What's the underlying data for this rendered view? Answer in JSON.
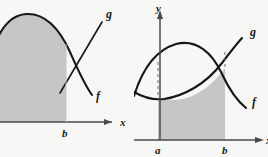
{
  "figure": {
    "background_color": "#f7f7f6",
    "shade_color": "#c6c6c4",
    "curve_color": "#161616",
    "axis_color": "#4a4a4a",
    "panels": [
      {
        "id": "left",
        "axes": {
          "x_label": "x",
          "y_label": "",
          "x_axis_visible": true,
          "y_axis_visible": false
        },
        "tick_labels": [
          "b"
        ],
        "curve_labels": [
          "g",
          "f"
        ],
        "description_curves": [
          {
            "name": "f",
            "label": "f",
            "shape": "downward parabola, cut off at left edge of panel"
          },
          {
            "name": "g",
            "label": "g",
            "shape": "increasing straight line crossing f"
          }
        ],
        "shaded_region": {
          "upper_boundary": "f",
          "lower_boundary": "x-axis",
          "left_boundary": "panel edge",
          "right_boundary": "b"
        }
      },
      {
        "id": "right",
        "axes": {
          "x_label": "x",
          "y_label": "y",
          "x_axis_visible": true,
          "y_axis_visible": true
        },
        "tick_labels": [
          "a",
          "b"
        ],
        "curve_labels": [
          "g",
          "f"
        ],
        "description_curves": [
          {
            "name": "f",
            "label": "f",
            "shape": "downward parabola / concave-up lower arc forming upper boundary of shaded region"
          },
          {
            "name": "g",
            "label": "g",
            "shape": "increasing straight line crossing f near b"
          }
        ],
        "shaded_region": {
          "upper_boundary": "lower arc",
          "lower_boundary": "x-axis",
          "left_boundary": "a",
          "right_boundary": "b"
        },
        "dashed_guides": [
          "a",
          "b"
        ]
      }
    ]
  }
}
